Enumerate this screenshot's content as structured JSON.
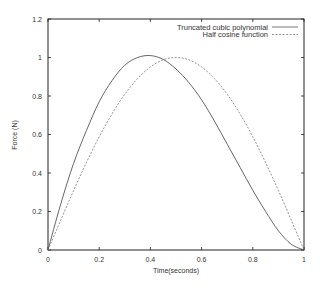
{
  "chart_data": {
    "type": "line",
    "title": "",
    "xlabel": "Time(seconds)",
    "ylabel": "Force (N)",
    "xlim": [
      0,
      1
    ],
    "ylim": [
      0,
      1.2
    ],
    "xticks": [
      "0",
      "0.2",
      "0.4",
      "0.6",
      "0.8",
      "1"
    ],
    "yticks": [
      "0",
      "0.2",
      "0.4",
      "0.6",
      "0.8",
      "1",
      "1.2"
    ],
    "grid": false,
    "legend_position": "top-right",
    "series": [
      {
        "name": "Truncated cubic polynomial",
        "style": "solid",
        "x": [
          0,
          0.05,
          0.1,
          0.15,
          0.2,
          0.25,
          0.3,
          0.35,
          0.4,
          0.45,
          0.5,
          0.55,
          0.6,
          0.65,
          0.7,
          0.75,
          0.8,
          0.85,
          0.9,
          0.95,
          1.0
        ],
        "values": [
          0,
          0.24,
          0.45,
          0.62,
          0.77,
          0.88,
          0.96,
          1.0,
          1.01,
          0.99,
          0.94,
          0.87,
          0.78,
          0.67,
          0.55,
          0.43,
          0.31,
          0.2,
          0.1,
          0.03,
          0
        ]
      },
      {
        "name": "Half cosine function",
        "style": "dashed",
        "x": [
          0,
          0.05,
          0.1,
          0.15,
          0.2,
          0.25,
          0.3,
          0.35,
          0.4,
          0.45,
          0.5,
          0.55,
          0.6,
          0.65,
          0.7,
          0.75,
          0.8,
          0.85,
          0.9,
          0.95,
          1.0
        ],
        "values": [
          0,
          0.156,
          0.309,
          0.454,
          0.588,
          0.707,
          0.809,
          0.891,
          0.951,
          0.988,
          1.0,
          0.988,
          0.951,
          0.891,
          0.809,
          0.707,
          0.588,
          0.454,
          0.309,
          0.156,
          0
        ]
      }
    ]
  },
  "legend": {
    "items": [
      "Truncated cubic polynomial",
      "Half cosine function"
    ]
  },
  "axes": {
    "xlabel": "Time(seconds)",
    "ylabel": "Force (N)"
  }
}
